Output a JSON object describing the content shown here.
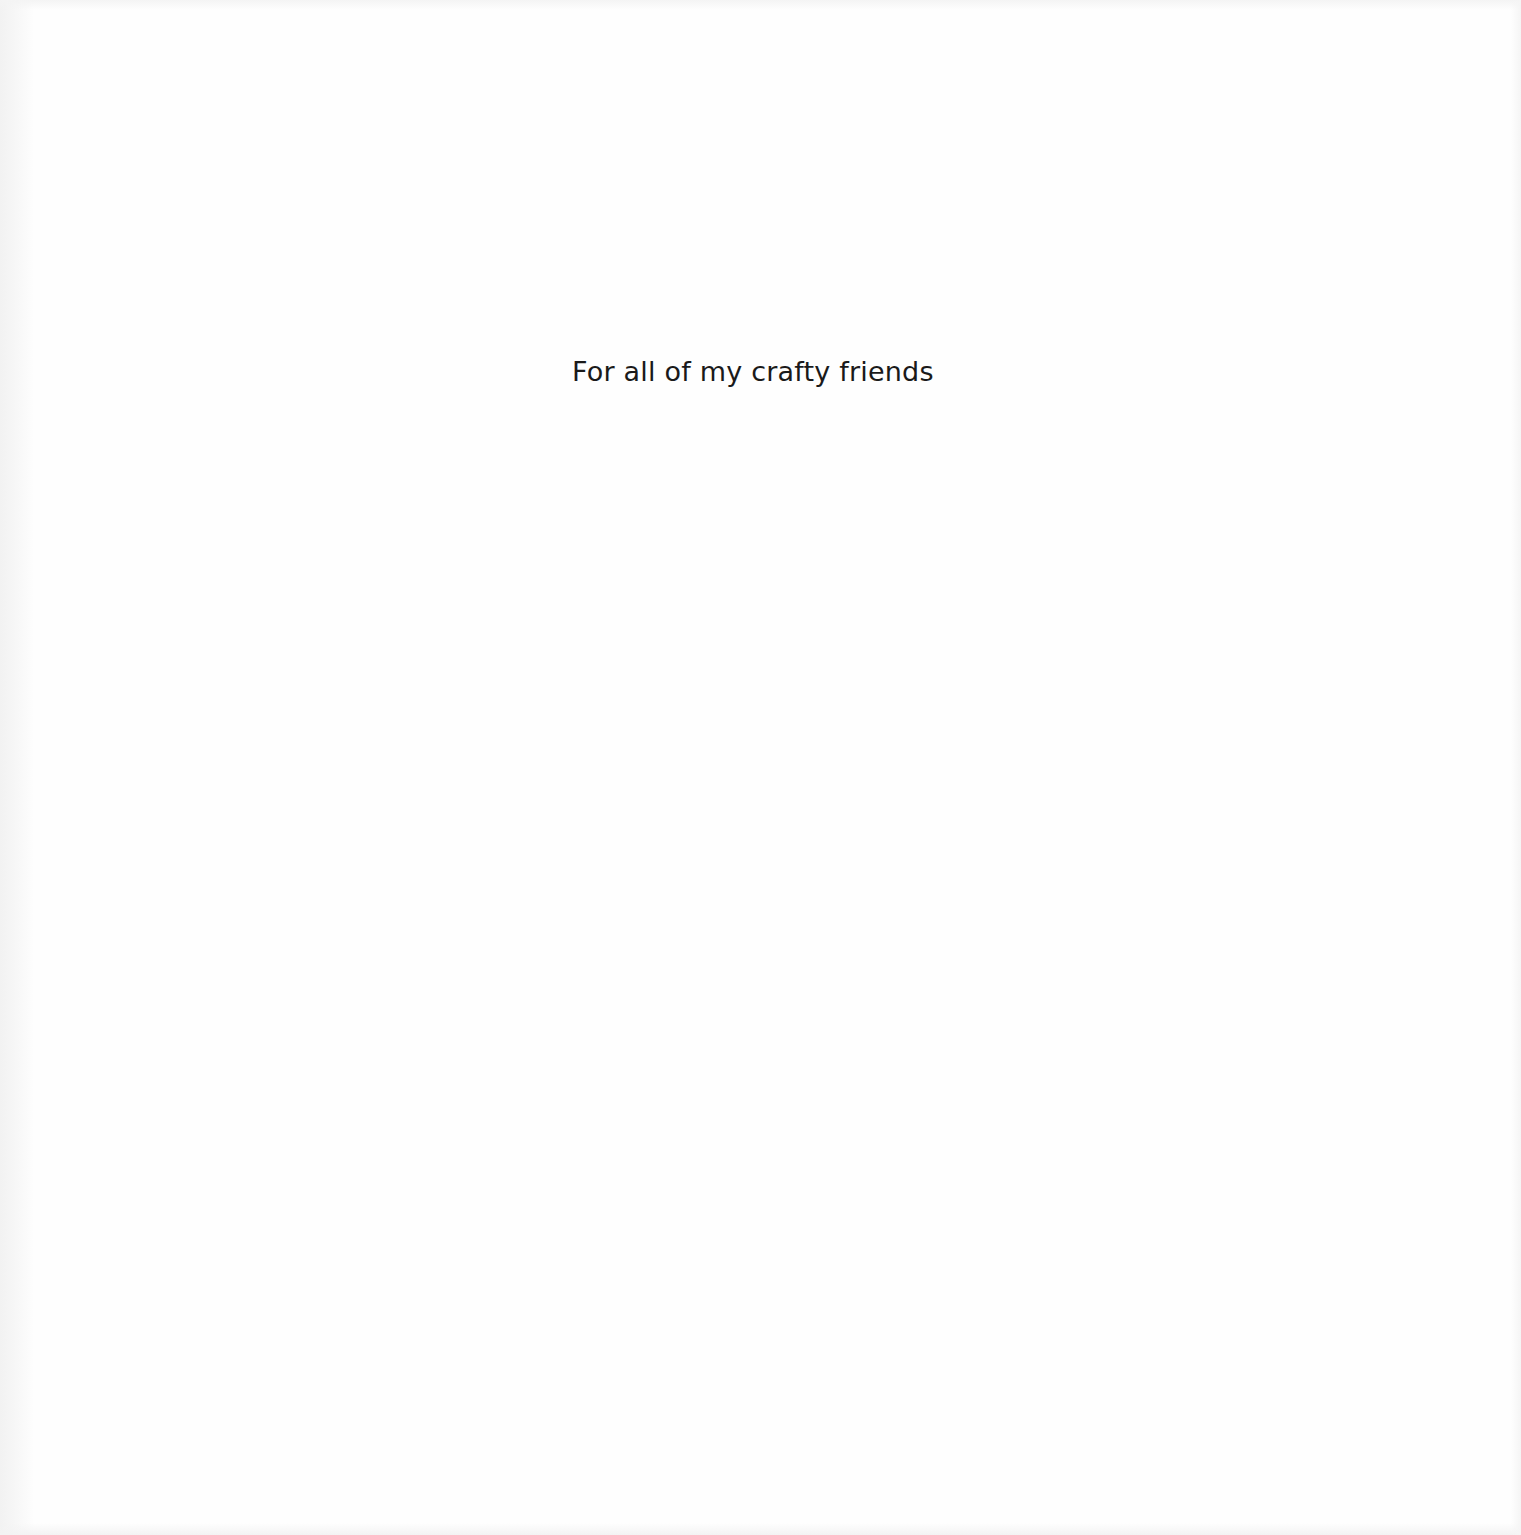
{
  "page": {
    "type": "dedication",
    "dedication_text": "For all of my crafty friends",
    "colors": {
      "background": "#fefefe",
      "text": "#1a1a1a"
    }
  }
}
